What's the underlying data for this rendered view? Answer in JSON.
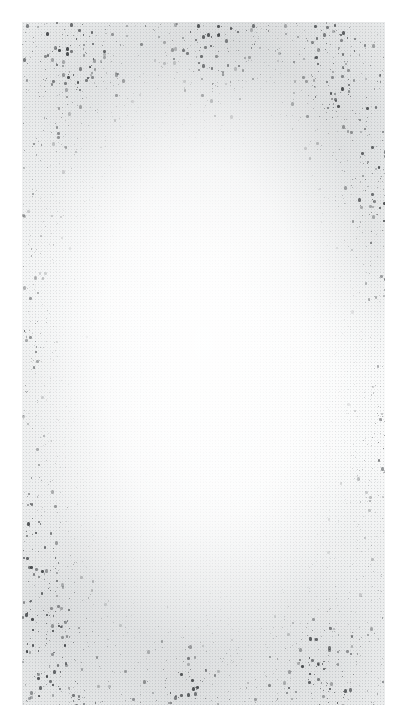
{
  "image": {
    "kind": "grain-texture",
    "description": "Monochrome scanned-paper grain / film noise texture on a white page",
    "width": 407,
    "height": 728,
    "page_background": "#ffffff",
    "field_background": "#f8f9f9",
    "speck_color": "#2e3134",
    "margin": {
      "left": 22,
      "top": 22,
      "right": 22,
      "bottom": 23
    },
    "field": {
      "x": 22,
      "y": 22,
      "width": 363,
      "height": 683
    },
    "noise": {
      "seed": 20240607,
      "speck_count": 5200,
      "min_size": 1,
      "max_size": 3,
      "base_opacity": 0.08,
      "max_opacity": 0.85,
      "center_falloff": 0.62
    },
    "density_hotspots": [
      {
        "name": "top-left",
        "cx": 0.14,
        "cy": 0.07,
        "r": 0.3,
        "weight": 0.85
      },
      {
        "name": "top-center",
        "cx": 0.52,
        "cy": 0.03,
        "r": 0.26,
        "weight": 1.0
      },
      {
        "name": "top-right",
        "cx": 0.86,
        "cy": 0.1,
        "r": 0.26,
        "weight": 0.92
      },
      {
        "name": "right-upper",
        "cx": 0.97,
        "cy": 0.27,
        "r": 0.2,
        "weight": 0.7
      },
      {
        "name": "left-middle",
        "cx": 0.02,
        "cy": 0.46,
        "r": 0.18,
        "weight": 0.5
      },
      {
        "name": "left-lower",
        "cx": 0.03,
        "cy": 0.74,
        "r": 0.2,
        "weight": 0.55
      },
      {
        "name": "bottom-left",
        "cx": 0.1,
        "cy": 0.9,
        "r": 0.28,
        "weight": 0.98
      },
      {
        "name": "bottom-center",
        "cx": 0.46,
        "cy": 0.99,
        "r": 0.24,
        "weight": 0.8
      },
      {
        "name": "bottom-right",
        "cx": 0.82,
        "cy": 0.94,
        "r": 0.26,
        "weight": 0.9
      },
      {
        "name": "right-lower",
        "cx": 0.99,
        "cy": 0.62,
        "r": 0.16,
        "weight": 0.45
      }
    ]
  }
}
